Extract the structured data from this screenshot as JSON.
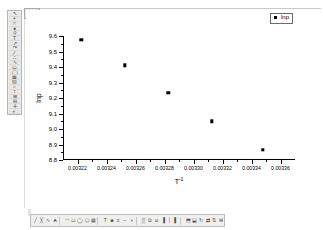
{
  "window": {
    "title_bar_icon": "restore-icon"
  },
  "left_toolbar": {
    "name": "graph-tools-toolbar",
    "items": [
      {
        "icon": "pointer-icon",
        "glyph": "↖"
      },
      {
        "icon": "screen-reader-icon",
        "glyph": "⌖"
      },
      {
        "icon": "data-reader-icon",
        "glyph": "⌗"
      },
      {
        "icon": "data-selector-icon",
        "glyph": "●"
      },
      {
        "icon": "zoom-icon",
        "glyph": "⚲"
      },
      {
        "icon": "text-tool-icon",
        "glyph": "T"
      },
      {
        "icon": "arrow-tool-icon",
        "glyph": "↗"
      },
      {
        "icon": "curve-arrow-icon",
        "glyph": "↷"
      },
      {
        "icon": "line-tool-icon",
        "glyph": "╱"
      },
      {
        "icon": "polyline-icon",
        "glyph": "∴"
      },
      {
        "icon": "freehand-icon",
        "glyph": "∿"
      },
      {
        "icon": "rectangle-icon",
        "glyph": "▭"
      },
      {
        "icon": "ellipse-icon",
        "glyph": "◯"
      },
      {
        "icon": "region-icon",
        "glyph": "▦"
      },
      {
        "icon": "mask-icon",
        "glyph": "▨"
      },
      {
        "icon": "magnify-icon",
        "glyph": "⌕"
      },
      {
        "icon": "scale-icon",
        "glyph": "↕"
      },
      {
        "icon": "zoom-in-icon",
        "glyph": "⊞"
      },
      {
        "icon": "zoom-out-icon",
        "glyph": "⊟"
      },
      {
        "icon": "pan-icon",
        "glyph": "✛"
      },
      {
        "icon": "color-picker-icon",
        "glyph": "◐"
      }
    ]
  },
  "bottom_toolbar": {
    "name": "drawing-toolbar",
    "items": [
      {
        "icon": "line-icon",
        "glyph": "╱"
      },
      {
        "icon": "polyline-icon",
        "glyph": "╳"
      },
      {
        "icon": "freehand-icon",
        "glyph": "∿"
      },
      {
        "icon": "arrow-icon",
        "glyph": "⮝"
      },
      {
        "icon": "curve-icon",
        "glyph": "◠"
      },
      {
        "icon": "rectangle-icon",
        "glyph": "▭"
      },
      {
        "icon": "ellipse-icon",
        "glyph": "◯"
      },
      {
        "icon": "polygon-icon",
        "glyph": "⬠"
      },
      {
        "icon": "region-icon",
        "glyph": "▦"
      },
      {
        "icon": "text-icon",
        "glyph": "T"
      },
      {
        "icon": "fill-icon",
        "glyph": "■"
      },
      {
        "icon": "line-width-icon",
        "glyph": "≡"
      },
      {
        "icon": "line-style-icon",
        "glyph": "┄"
      },
      {
        "icon": "color-icon",
        "glyph": "◑"
      },
      {
        "icon": "pattern-icon",
        "glyph": "▒"
      },
      {
        "icon": "group-icon",
        "glyph": "⧉"
      },
      {
        "icon": "ungroup-icon",
        "glyph": "⧈"
      },
      {
        "icon": "align-left-icon",
        "glyph": "▐"
      },
      {
        "icon": "align-center-icon",
        "glyph": "│"
      },
      {
        "icon": "align-right-icon",
        "glyph": "▌"
      },
      {
        "icon": "front-icon",
        "glyph": "⬒"
      },
      {
        "icon": "back-icon",
        "glyph": "⬓"
      },
      {
        "icon": "rotate-icon",
        "glyph": "↻"
      },
      {
        "icon": "flip-h-icon",
        "glyph": "⇄"
      },
      {
        "icon": "flip-v-icon",
        "glyph": "⇅"
      },
      {
        "icon": "lock-icon",
        "glyph": "⊞"
      }
    ]
  },
  "chart_data": {
    "type": "scatter",
    "title": "",
    "xlabel": "T⁻¹",
    "xlabel_base": "T",
    "xlabel_sup": "-1",
    "ylabel": "lnp",
    "xlim": [
      0.00321,
      0.00337
    ],
    "ylim": [
      8.8,
      9.6
    ],
    "xticks": [
      0.00322,
      0.00324,
      0.00326,
      0.00328,
      0.0033,
      0.00332,
      0.00334,
      0.00336
    ],
    "xtick_labels": [
      "0.00322",
      "0.00324",
      "0.00326",
      "0.00328",
      "0.00330",
      "0.00332",
      "0.00334",
      "0.00336"
    ],
    "yticks": [
      8.8,
      8.9,
      9.0,
      9.1,
      9.2,
      9.3,
      9.4,
      9.5,
      9.6
    ],
    "ytick_labels": [
      "8.8",
      "8.9",
      "9.0",
      "9.1",
      "9.2",
      "9.3",
      "9.4",
      "9.5",
      "9.6"
    ],
    "grid": false,
    "legend_position": "top-right",
    "series": [
      {
        "name": "lnp",
        "marker": "square",
        "color": "#000000",
        "x": [
          0.0032225,
          0.0032525,
          0.0032825,
          0.0033125,
          0.003348
        ],
        "y": [
          9.575,
          9.41,
          9.235,
          9.05,
          8.865
        ]
      }
    ]
  },
  "legend": {
    "entries": [
      {
        "label": "lnp",
        "marker": "square-marker"
      }
    ]
  }
}
